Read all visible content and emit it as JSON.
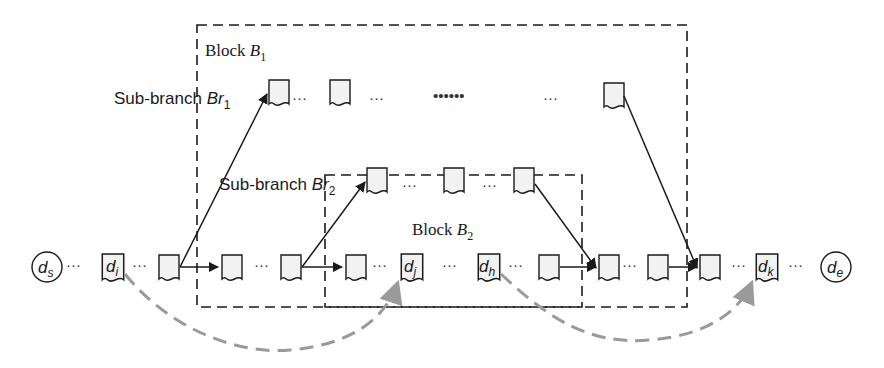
{
  "blocks": [
    {
      "id": "B1",
      "label": "Block ",
      "var": "B",
      "sub": "1"
    },
    {
      "id": "B2",
      "label": "Block ",
      "var": "B",
      "sub": "2"
    }
  ],
  "sub_branches": [
    {
      "id": "Br1",
      "label": "Sub-branch ",
      "var": "Br",
      "sub": "1"
    },
    {
      "id": "Br2",
      "label": "Sub-branch ",
      "var": "Br",
      "sub": "2"
    }
  ],
  "main_chain": {
    "start": {
      "var": "d",
      "sub": "s"
    },
    "end": {
      "var": "d",
      "sub": "e"
    },
    "labeled_docs": [
      {
        "var": "d",
        "sub": "i"
      },
      {
        "var": "d",
        "sub": "j"
      },
      {
        "var": "d",
        "sub": "h"
      },
      {
        "var": "d",
        "sub": "k"
      }
    ]
  },
  "ellipsis": "···",
  "long_ellipsis": "••••••",
  "edges": {
    "dashed_curves": [
      {
        "from": "d_i",
        "to": "d_j"
      },
      {
        "from": "d_h",
        "to": "d_k"
      }
    ]
  },
  "colors": {
    "line": "#1a1a1a",
    "doc_fill": "#f2f2f2",
    "curve": "#9a9a9a",
    "block_border": "#1a1a1a"
  }
}
